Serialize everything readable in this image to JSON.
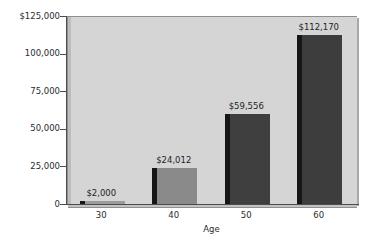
{
  "chart_data": {
    "type": "bar",
    "title": "",
    "subtitle": "",
    "xlabel": "Age",
    "ylabel": "",
    "categories": [
      "30",
      "40",
      "50",
      "60"
    ],
    "values": [
      2000,
      24012,
      59556,
      112170
    ],
    "data_labels": [
      "$2,000",
      "$24,012",
      "$59,556",
      "$112,170"
    ],
    "ylim": [
      0,
      125000
    ],
    "ytick_values": [
      0,
      25000,
      50000,
      75000,
      100000,
      125000
    ],
    "ytick_labels": [
      "0",
      "25,000",
      "50,000",
      "75,000",
      "100,000",
      "$125,000"
    ],
    "xtick_labels": [
      "30",
      "40",
      "50",
      "60"
    ],
    "grid": false,
    "legend": null,
    "series": [
      {
        "name": "Savings by Age",
        "values": [
          2000,
          24012,
          59556,
          112170
        ]
      }
    ],
    "bar_colors": [
      "#9c9c9c",
      "#8a8a8a",
      "#3f3f3f",
      "#3d3d3d"
    ],
    "bar_side_color": "#161616",
    "plot_background": "#d5d5d5",
    "page_background": "#ffffff",
    "axis_color": "#4d4d4d",
    "text_color": "#2b2b2b"
  },
  "axis": {
    "x_title": "Age"
  }
}
